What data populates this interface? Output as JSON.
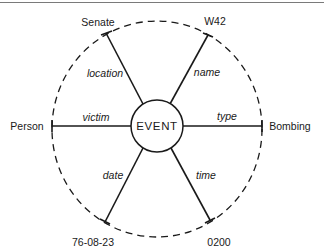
{
  "diagram": {
    "type": "semantic-network / case frame",
    "center": {
      "label": "EVENT"
    },
    "slots": [
      {
        "id": "location",
        "relation": "location",
        "filler": "Senate"
      },
      {
        "id": "name",
        "relation": "name",
        "filler": "W42"
      },
      {
        "id": "type",
        "relation": "type",
        "filler": "Bombing"
      },
      {
        "id": "time",
        "relation": "time",
        "filler": "0200"
      },
      {
        "id": "date",
        "relation": "date",
        "filler": "76-08-23"
      },
      {
        "id": "victim",
        "relation": "victim",
        "filler": "Person"
      }
    ],
    "outer_boundary": "dashed circle",
    "colors": {
      "stroke": "#1a1a1a",
      "background": "#ffffff",
      "rule": "#7a7a7a"
    }
  }
}
